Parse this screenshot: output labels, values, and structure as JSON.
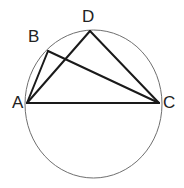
{
  "figure": {
    "name": "circle-with-inscribed-quadrilateral",
    "type": "geometry-diagram",
    "background_color": "#ffffff",
    "circle": {
      "name": "circumscribed-circle",
      "center_x": 93.5,
      "center_y": 104,
      "radius_x": 68.5,
      "radius_y": 74,
      "stroke_color": "#6f6f6f",
      "stroke_width": 1
    },
    "chord_color": "#1a1a1a",
    "chord_width": 2,
    "points": [
      {
        "id": "A",
        "label": "A",
        "x": 27,
        "y": 103,
        "label_x": 12,
        "label_y": 94
      },
      {
        "id": "B",
        "label": "B",
        "x": 48,
        "y": 51,
        "label_x": 28,
        "label_y": 28
      },
      {
        "id": "C",
        "label": "C",
        "x": 159,
        "y": 103,
        "label_x": 163,
        "label_y": 94
      },
      {
        "id": "D",
        "label": "D",
        "x": 90,
        "y": 31,
        "label_x": 82,
        "label_y": 8
      }
    ],
    "segments": [
      {
        "id": "AB",
        "from": "A",
        "to": "B",
        "label": "segment-a-b"
      },
      {
        "id": "AD",
        "from": "A",
        "to": "D",
        "label": "segment-a-d"
      },
      {
        "id": "AC",
        "from": "A",
        "to": "C",
        "label": "segment-a-c"
      },
      {
        "id": "BC",
        "from": "B",
        "to": "C",
        "label": "segment-b-c"
      },
      {
        "id": "DC",
        "from": "D",
        "to": "C",
        "label": "segment-d-c"
      }
    ]
  }
}
